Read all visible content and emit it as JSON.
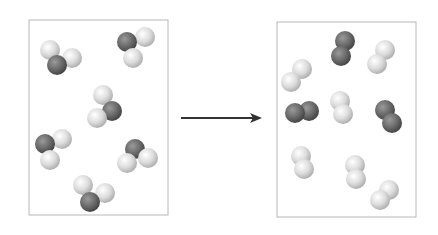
{
  "diagram": {
    "colors": {
      "dark_atom": "#6e6e6e",
      "light_atom": "#d9d9d9",
      "box_border": "#b8b8b8",
      "arrow": "#333333"
    },
    "atom_radius": 10,
    "reactants_box": {
      "x": 29,
      "y": 20,
      "w": 139,
      "h": 195
    },
    "products_box": {
      "x": 277,
      "y": 22,
      "w": 139,
      "h": 195
    },
    "arrow": {
      "x1": 181,
      "y1": 118,
      "x2": 262,
      "y2": 118
    },
    "reactants": [
      {
        "atoms": [
          {
            "x": 50,
            "y": 50,
            "t": "light"
          },
          {
            "x": 57,
            "y": 65,
            "t": "dark"
          },
          {
            "x": 72,
            "y": 58,
            "t": "light"
          }
        ]
      },
      {
        "atoms": [
          {
            "x": 127,
            "y": 42,
            "t": "dark"
          },
          {
            "x": 145,
            "y": 37,
            "t": "light"
          },
          {
            "x": 133,
            "y": 58,
            "t": "light"
          }
        ]
      },
      {
        "atoms": [
          {
            "x": 103,
            "y": 95,
            "t": "light"
          },
          {
            "x": 112,
            "y": 111,
            "t": "dark"
          },
          {
            "x": 97,
            "y": 118,
            "t": "light"
          }
        ]
      },
      {
        "atoms": [
          {
            "x": 45,
            "y": 144,
            "t": "dark"
          },
          {
            "x": 62,
            "y": 139,
            "t": "light"
          },
          {
            "x": 50,
            "y": 160,
            "t": "light"
          }
        ]
      },
      {
        "atoms": [
          {
            "x": 135,
            "y": 149,
            "t": "dark"
          },
          {
            "x": 148,
            "y": 158,
            "t": "light"
          },
          {
            "x": 127,
            "y": 163,
            "t": "light"
          }
        ]
      },
      {
        "atoms": [
          {
            "x": 83,
            "y": 185,
            "t": "light"
          },
          {
            "x": 90,
            "y": 202,
            "t": "dark"
          },
          {
            "x": 105,
            "y": 193,
            "t": "light"
          }
        ]
      }
    ],
    "products": [
      {
        "atoms": [
          {
            "x": 345,
            "y": 41,
            "t": "dark"
          },
          {
            "x": 341,
            "y": 56,
            "t": "dark"
          }
        ]
      },
      {
        "atoms": [
          {
            "x": 385,
            "y": 50,
            "t": "light"
          },
          {
            "x": 377,
            "y": 64,
            "t": "light"
          }
        ]
      },
      {
        "atoms": [
          {
            "x": 302,
            "y": 69,
            "t": "light"
          },
          {
            "x": 291,
            "y": 82,
            "t": "light"
          }
        ]
      },
      {
        "atoms": [
          {
            "x": 309,
            "y": 111,
            "t": "dark"
          },
          {
            "x": 295,
            "y": 113,
            "t": "dark"
          }
        ]
      },
      {
        "atoms": [
          {
            "x": 340,
            "y": 101,
            "t": "light"
          },
          {
            "x": 343,
            "y": 114,
            "t": "light"
          }
        ]
      },
      {
        "atoms": [
          {
            "x": 385,
            "y": 110,
            "t": "dark"
          },
          {
            "x": 392,
            "y": 123,
            "t": "dark"
          }
        ]
      },
      {
        "atoms": [
          {
            "x": 301,
            "y": 156,
            "t": "light"
          },
          {
            "x": 304,
            "y": 169,
            "t": "light"
          }
        ]
      },
      {
        "atoms": [
          {
            "x": 355,
            "y": 165,
            "t": "light"
          },
          {
            "x": 356,
            "y": 179,
            "t": "light"
          }
        ]
      },
      {
        "atoms": [
          {
            "x": 389,
            "y": 190,
            "t": "light"
          },
          {
            "x": 380,
            "y": 200,
            "t": "light"
          }
        ]
      }
    ]
  }
}
